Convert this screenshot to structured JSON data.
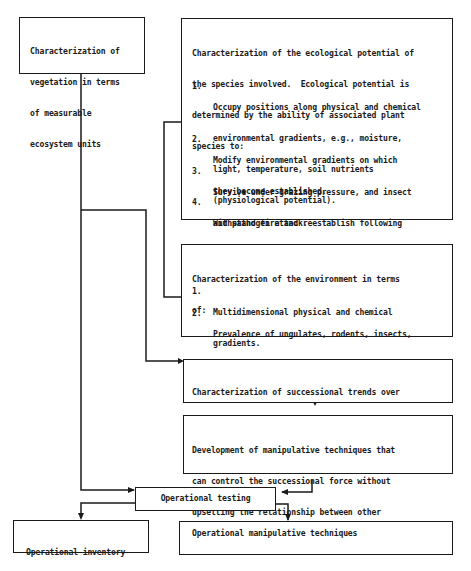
{
  "diagram": {
    "vegetation_box": {
      "lines": [
        "Characterization of",
        "vegetation in terms",
        "of measurable",
        "ecosystem units"
      ]
    },
    "ecological_box": {
      "intro": [
        "Characterization of the ecological potential of",
        "the species involved.  Ecological potential is",
        "determined by the ability of associated plant",
        "species to:"
      ],
      "items": [
        {
          "num": "1.",
          "lines": [
            "Occupy positions along physical and chemical",
            "environmental gradients, e.g., moisture,",
            "light, temperature, soil nutrients",
            "(physiological potential)."
          ]
        },
        {
          "num": "2.",
          "lines": [
            "Modify environmental gradients on which",
            "they become established."
          ]
        },
        {
          "num": "3.",
          "lines": [
            "Survive under grazing pressure, and insect",
            "and pathogen attack."
          ]
        },
        {
          "num": "4.",
          "lines": [
            "Withstand fire and reestablish following",
            "fire."
          ]
        }
      ]
    },
    "environment_box": {
      "intro": [
        "Characterization of the environment in terms",
        "of:"
      ],
      "items": [
        {
          "num": "1.",
          "lines": [
            "Multidimensional physical and chemical",
            "gradients."
          ]
        },
        {
          "num": "2.",
          "lines": [
            "Prevalence of ungulates, rodents, insects,",
            "pathogens, and fire."
          ]
        }
      ]
    },
    "successional_box": {
      "lines": [
        "Characterization of successional trends over",
        "the variety of environments involved",
        "(successional potential)."
      ]
    },
    "manipulative_dev_box": {
      "lines": [
        "Development of manipulative techniques that",
        "can control the successional force without",
        "upsetting the relationship between other",
        "organisms in the ecosystem."
      ]
    },
    "operational_testing_box": {
      "label": "Operational testing"
    },
    "inventory_box": {
      "lines": [
        "Operational inventory",
        "techniques"
      ]
    },
    "manipulative_ops_box": {
      "label": "Operational manipulative techniques"
    }
  }
}
